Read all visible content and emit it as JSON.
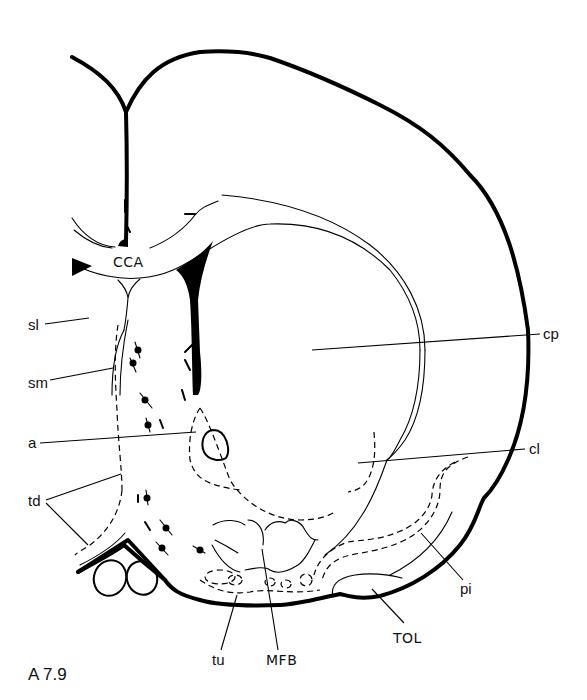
{
  "figure": {
    "plate_label": "A 7.9",
    "labels": {
      "CCA": "CCA",
      "sl": "sl",
      "sm": "sm",
      "a": "a",
      "td": "td",
      "cp": "cp",
      "cl": "cl",
      "pi": "pi",
      "tu": "tu",
      "MFB": "MFB",
      "TOL": "TOL"
    },
    "colors": {
      "ink": "#000000",
      "background": "#ffffff"
    }
  }
}
